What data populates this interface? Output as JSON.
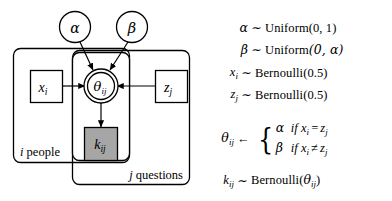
{
  "diagram": {
    "type": "bayesian-plate-notation",
    "nodes": [
      {
        "id": "alpha",
        "label": "α",
        "shape": "circle",
        "observed": false
      },
      {
        "id": "beta",
        "label": "β",
        "shape": "circle",
        "observed": false
      },
      {
        "id": "theta",
        "label": "θ",
        "sub": "ij",
        "shape": "double-circle",
        "observed": false
      },
      {
        "id": "x",
        "label": "x",
        "sub": "i",
        "shape": "square",
        "observed": false
      },
      {
        "id": "z",
        "label": "z",
        "sub": "j",
        "shape": "square",
        "observed": false
      },
      {
        "id": "k",
        "label": "k",
        "sub": "ij",
        "shape": "square",
        "observed": true
      }
    ],
    "plates": [
      {
        "id": "people",
        "index": "i",
        "label": "people",
        "full_label": "i people"
      },
      {
        "id": "questions",
        "index": "j",
        "label": "questions",
        "full_label": "j questions"
      }
    ],
    "edges": [
      {
        "from": "alpha",
        "to": "theta"
      },
      {
        "from": "beta",
        "to": "theta"
      },
      {
        "from": "x",
        "to": "theta"
      },
      {
        "from": "z",
        "to": "theta"
      },
      {
        "from": "theta",
        "to": "k"
      }
    ],
    "colors": {
      "stroke": "#000000",
      "background": "#ffffff",
      "observed_fill": "#a6a6a6"
    }
  },
  "equations": {
    "line1": {
      "lhs": "α",
      "rel": "∼",
      "rhs_name": "Uniform",
      "rhs_args": "(0, 1)"
    },
    "line2": {
      "lhs": "β",
      "rel": "∼",
      "rhs_name": "Uniform",
      "rhs_args": "(0, α)"
    },
    "line3": {
      "lhs_var": "x",
      "lhs_sub": "i",
      "rel": "∼",
      "rhs_name": "Bernoulli",
      "rhs_args": "(0.5)"
    },
    "line4": {
      "lhs_var": "z",
      "lhs_sub": "j",
      "rel": "∼",
      "rhs_name": "Bernoulli",
      "rhs_args": "(0.5)"
    },
    "line5": {
      "lhs_var": "θ",
      "lhs_sub": "ij",
      "rel": "←",
      "case_a_value": "α",
      "case_a_if": "if",
      "case_a_left": "x",
      "case_a_left_sub": "i",
      "case_a_op": "=",
      "case_a_right": "z",
      "case_a_right_sub": "j",
      "case_b_value": "β",
      "case_b_if": "if",
      "case_b_left": "x",
      "case_b_left_sub": "i",
      "case_b_op": "≠",
      "case_b_right": "z",
      "case_b_right_sub": "j"
    },
    "line6": {
      "lhs_var": "k",
      "lhs_sub": "ij",
      "rel": "∼",
      "rhs_name": "Bernoulli",
      "rhs_open": "(",
      "rhs_arg_var": "θ",
      "rhs_arg_sub": "ij",
      "rhs_close": ")"
    }
  }
}
